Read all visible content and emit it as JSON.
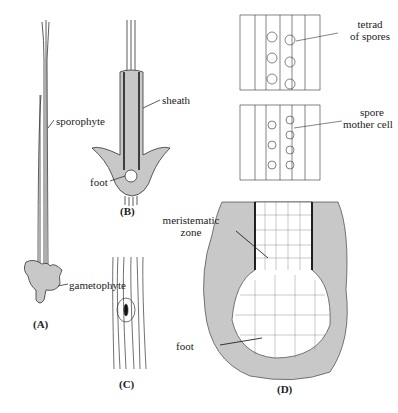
{
  "figure": {
    "panels": [
      {
        "id": "A",
        "label": "(A)",
        "annotations": [
          "sporophyte",
          "gametophyte"
        ]
      },
      {
        "id": "B",
        "label": "(B)",
        "annotations": [
          "sheath",
          "foot"
        ]
      },
      {
        "id": "C",
        "label": "(C)",
        "annotations": []
      },
      {
        "id": "D",
        "label": "(D)",
        "annotations": [
          "meristematic zone",
          "foot"
        ]
      }
    ],
    "upper_right": {
      "tetrad_label_line1": "tetrad",
      "tetrad_label_line2": "of spores",
      "spore_label_line1": "spore",
      "spore_label_line2": "mother cell"
    },
    "panel_a": {
      "label": "(A)",
      "sporophyte": "sporophyte",
      "gametophyte": "gametophyte"
    },
    "panel_b": {
      "label": "(B)",
      "sheath": "sheath",
      "foot": "foot"
    },
    "panel_c": {
      "label": "(C)"
    },
    "panel_d": {
      "label": "(D)",
      "meristematic_line1": "meristematic",
      "meristematic_line2": "zone",
      "foot": "foot"
    },
    "colors": {
      "tissue_fill": "#c8c8c8",
      "line": "#333333",
      "background": "#ffffff"
    }
  }
}
